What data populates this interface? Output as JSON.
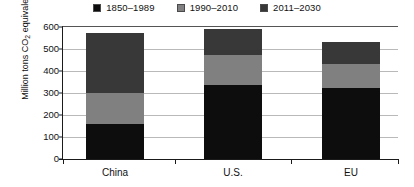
{
  "chart_data": {
    "type": "bar",
    "stacked": true,
    "title": "",
    "xlabel": "",
    "ylabel": "Million tons CO2 equivalent",
    "ylabel_html": "Million tons CO₂ equivalent",
    "categories": [
      "China",
      "U.S.",
      "EU"
    ],
    "series": [
      {
        "name": "1850–1989",
        "color": "#0d0d0d",
        "values": [
          160,
          335,
          323
        ]
      },
      {
        "name": "1990–2010",
        "color": "#808080",
        "values": [
          140,
          140,
          107
        ]
      },
      {
        "name": "2011–2030",
        "color": "#383838",
        "values": [
          273,
          115,
          102
        ]
      }
    ],
    "totals": [
      573,
      590,
      532
    ],
    "ylim": [
      0,
      600
    ],
    "yticks": [
      0,
      100,
      200,
      300,
      400,
      500,
      600
    ],
    "ytick_labels": [
      "0",
      "100",
      "200",
      "300",
      "400",
      "500",
      "600"
    ],
    "grid": true,
    "grid_axis": "y",
    "legend_position": "top-center"
  },
  "legend": {
    "items": [
      {
        "label": "1850–1989",
        "color": "#0d0d0d"
      },
      {
        "label": "1990–2010",
        "color": "#808080"
      },
      {
        "label": "2011–2030",
        "color": "#383838"
      }
    ]
  },
  "axes": {
    "y_title_prefix": "Million tons CO",
    "y_title_sub": "2",
    "y_title_suffix": " equivalent",
    "y_ticks": [
      "600",
      "500",
      "400",
      "300",
      "200",
      "100",
      "0"
    ],
    "x_ticks": [
      "China",
      "U.S.",
      "EU"
    ]
  },
  "colors": {
    "background": "#ffffff",
    "axis": "#1a1a1a",
    "grid": "#b9b9b9",
    "text": "#111111",
    "series_1850_1989": "#0d0d0d",
    "series_1990_2010": "#808080",
    "series_2011_2030": "#383838"
  }
}
